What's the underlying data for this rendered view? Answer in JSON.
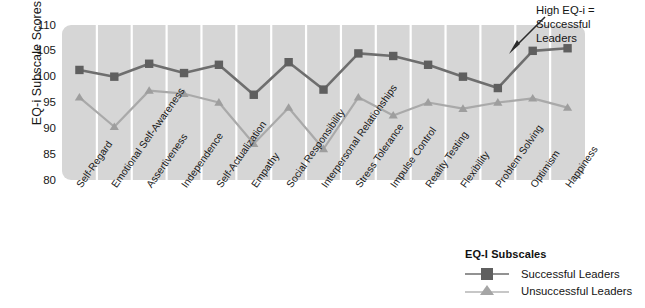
{
  "chart_data": {
    "type": "line",
    "title": "",
    "xlabel": "",
    "ylabel": "EQ-i Subscale Scores",
    "ylim": [
      80,
      110
    ],
    "yticks": [
      80,
      85,
      90,
      95,
      100,
      105,
      110
    ],
    "grid": "vertical-white",
    "legend_position": "bottom-right",
    "legend_title": "EQ-I Subscales",
    "categories": [
      "Self-Regard",
      "Emotional Self-Awareness",
      "Assertiveness",
      "Independence",
      "Self-Actualization",
      "Empathy",
      "Social Responsibility",
      "Interpersonal Relationships",
      "Stress Tolerance",
      "Impulse Control",
      "Reality Testing",
      "Flexibility",
      "Problem Solving",
      "Optimism",
      "Happiness"
    ],
    "series": [
      {
        "name": "Successful Leaders",
        "marker": "square",
        "color": "#6e6e6e",
        "values": [
          101.3,
          100.0,
          102.5,
          100.7,
          102.3,
          96.5,
          102.8,
          97.5,
          104.5,
          104.0,
          102.3,
          100.0,
          97.8,
          105.0,
          105.5
        ]
      },
      {
        "name": "Unsuccessful Leaders",
        "marker": "triangle",
        "color": "#a9a9a9",
        "values": [
          96.0,
          90.3,
          97.3,
          96.7,
          95.0,
          87.0,
          94.0,
          86.0,
          96.0,
          92.5,
          95.0,
          93.8,
          95.0,
          95.8,
          94.0
        ]
      }
    ],
    "annotations": [
      {
        "text": "High EQ-i =\nSuccessful\nLeaders",
        "points_to": "Happiness"
      }
    ]
  },
  "colors": {
    "plot_background": "#d6d6d6",
    "gridline": "#ffffff",
    "successful": "#6e6e6e",
    "unsuccessful": "#a9a9a9",
    "text": "#171717"
  }
}
